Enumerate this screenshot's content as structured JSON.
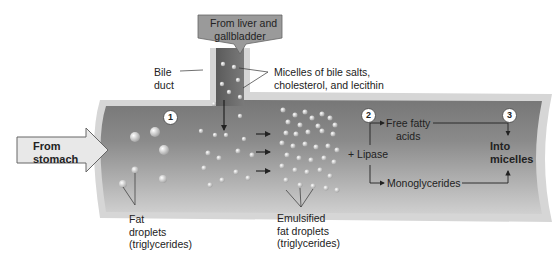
{
  "diagram": {
    "labels": {
      "from_liver": "From liver and gallbladder",
      "from_liver_line1": "From liver and",
      "from_liver_line2": "gallbladder",
      "bile_duct_line1": "Bile",
      "bile_duct_line2": "duct",
      "micelles_line1": "Micelles of bile salts,",
      "micelles_line2": "cholesterol, and lecithin",
      "from_stomach_line1": "From",
      "from_stomach_line2": "stomach",
      "fat_droplets_line1": "Fat",
      "fat_droplets_line2": "droplets",
      "fat_droplets_line3": "(triglycerides)",
      "emulsified_line1": "Emulsified",
      "emulsified_line2": "fat droplets",
      "emulsified_line3": "(triglycerides)",
      "lipase": "+ Lipase",
      "free_fatty_line1": "Free fatty",
      "free_fatty_line2": "acids",
      "monoglycerides": "Monoglycerides",
      "into_micelles_line1": "Into",
      "into_micelles_line2": "micelles"
    },
    "steps": [
      "1",
      "2",
      "3"
    ],
    "colors": {
      "intestine_dark": "#6e6e6e",
      "intestine_light": "#c8c8c8",
      "wall": "#d4d4d4",
      "arrow_fill": "#e6e6e6",
      "droplet": "#e8e8e8"
    }
  }
}
